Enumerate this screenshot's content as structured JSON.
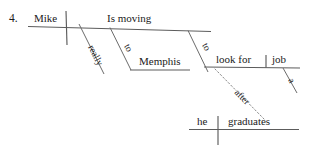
{
  "diagram": {
    "item_number": "4.",
    "type": "reed-kellogg-sentence-diagram",
    "ink_color": "#1a1a1a",
    "line_color": "#5c5c5c",
    "dotted_line_color": "#8a8a8a",
    "background_color": "#ffffff",
    "main_clause": {
      "subject": "Mike",
      "predicate": "Is moving"
    },
    "modifiers": {
      "adverb_really": "really",
      "prep_to_first": "to",
      "prep_object_memphis": "Memphis",
      "prep_to_second": "to",
      "infinitive_verb": "look for",
      "infinitive_object": "job",
      "article_a": "a"
    },
    "subordinate_clause": {
      "conjunction": "after",
      "subject": "he",
      "verb": "graduates"
    },
    "labels": [
      "4.",
      "Mike",
      "Is moving",
      "really",
      "to",
      "Memphis",
      "to",
      "look for",
      "job",
      "a",
      "after",
      "he",
      "graduates"
    ]
  }
}
